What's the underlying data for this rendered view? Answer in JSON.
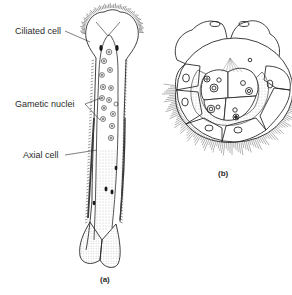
{
  "figure": {
    "panels": [
      {
        "id": "a",
        "caption": "(a)",
        "labels": [
          {
            "text": "Ciliated cell",
            "target": "ciliated-cell"
          },
          {
            "text": "Gametic nuclei",
            "target": "gametic-nuclei"
          },
          {
            "text": "Axial cell",
            "target": "axial-cell"
          }
        ]
      },
      {
        "id": "b",
        "caption": "(b)",
        "labels": []
      }
    ],
    "colors": {
      "ink": "#2a2a2a",
      "background": "#ffffff",
      "stipple": "#9a9a9a"
    }
  }
}
